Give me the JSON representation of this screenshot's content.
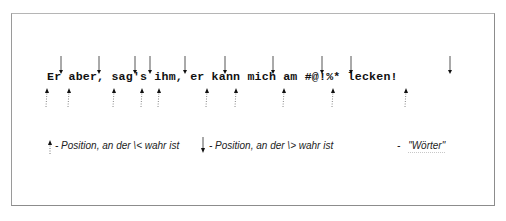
{
  "diagram": {
    "sentence": "Er aber, sag's ihm, er kann mich am #@!%* lecken!",
    "word_start_markers": {
      "description": "Position, an der \\< wahr ist",
      "style": "dotted-up-arrow",
      "x_positions": [
        47,
        69,
        114,
        142,
        159,
        207,
        236,
        284,
        333,
        406
      ]
    },
    "word_end_markers": {
      "description": "Position, an der \\> wahr ist",
      "style": "solid-down-arrow",
      "x_positions": [
        61,
        99,
        135,
        150,
        185,
        225,
        273,
        322,
        351,
        450
      ]
    }
  },
  "legend": {
    "start_label": "- Position, an der \\< wahr ist",
    "end_label": "- Position, an der \\> wahr ist",
    "words_dash": "-",
    "words_label": "\"Wörter\""
  }
}
